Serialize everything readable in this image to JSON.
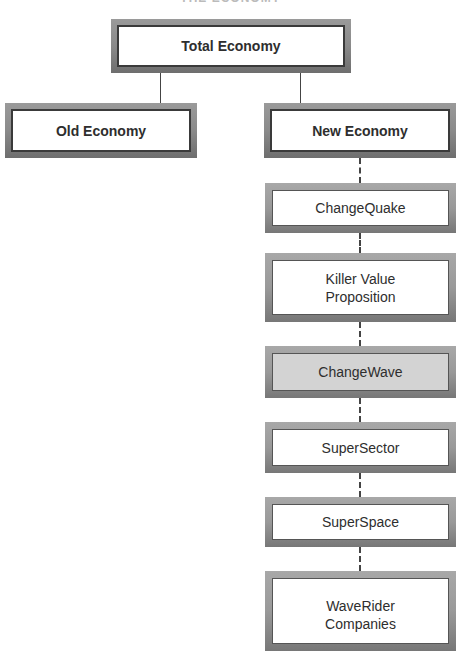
{
  "header": {
    "title": "THE ECONOMY"
  },
  "nodes": {
    "total": {
      "label": "Total Economy"
    },
    "old": {
      "label": "Old Economy"
    },
    "new": {
      "label": "New Economy"
    },
    "changequake": {
      "label": "ChangeQuake"
    },
    "killer_value": {
      "label_line1": "Killer Value",
      "label_line2": "Proposition"
    },
    "changewave": {
      "label": "ChangeWave"
    },
    "supersector": {
      "label": "SuperSector"
    },
    "superspace": {
      "label": "SuperSpace"
    },
    "waverider": {
      "label_line1": "WaveRider",
      "label_line2": "Companies"
    }
  },
  "colors": {
    "box_frame": "#8a8a8a",
    "box_fill": "#ffffff",
    "highlight_fill": "#d3d3d3",
    "connector": "#444444"
  }
}
